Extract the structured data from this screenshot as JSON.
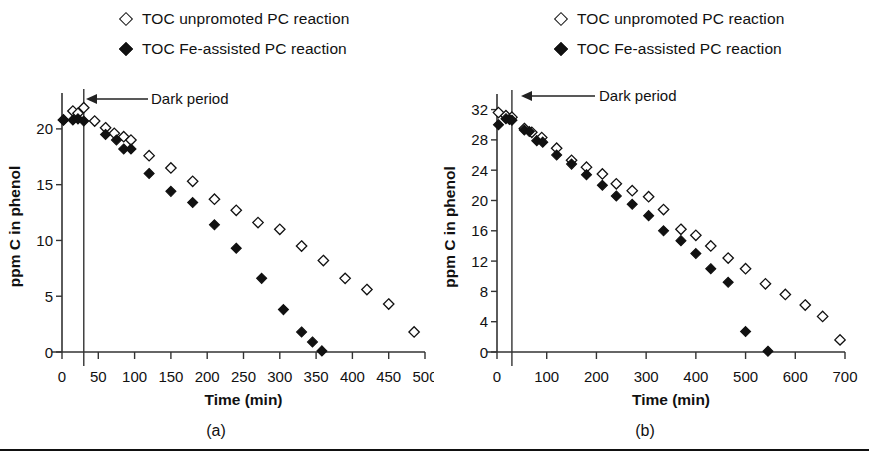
{
  "figure": {
    "background": "#ffffff",
    "marker_open_color": "#ffffff",
    "marker_edge_color": "#111111",
    "marker_filled_color": "#111111",
    "axis_color": "#333333"
  },
  "legend": {
    "series": [
      {
        "marker": "open-diamond-icon",
        "label": "TOC unpromoted PC reaction"
      },
      {
        "marker": "filled-diamond-icon",
        "label": "TOC Fe-assisted PC reaction"
      }
    ]
  },
  "panels": [
    {
      "id": "a",
      "caption": "(a)",
      "annotation": "Dark period"
    },
    {
      "id": "b",
      "caption": "(b)",
      "annotation": "Dark period"
    }
  ],
  "chart_data": [
    {
      "type": "scatter",
      "panel": "(a)",
      "title": "",
      "xlabel": "Time (min)",
      "ylabel": "ppm C in phenol",
      "xlim": [
        0,
        500
      ],
      "ylim": [
        0,
        22.5
      ],
      "xticks": [
        0,
        50,
        100,
        150,
        200,
        250,
        300,
        350,
        400,
        450,
        500
      ],
      "yticks": [
        0,
        5,
        10,
        15,
        20
      ],
      "xtick_labels": [
        "0",
        "50",
        "100",
        "150",
        "200",
        "250",
        "300",
        "350",
        "400",
        "450",
        "500"
      ],
      "ytick_labels": [
        "0",
        "5",
        "10",
        "15",
        "20"
      ],
      "grid": false,
      "legend_position": "top-center",
      "annotations": [
        {
          "text": "Dark period",
          "type": "arrow-left",
          "x": 30,
          "y": 22.2
        }
      ],
      "vertical_line": {
        "x": 30,
        "label": "dark period end"
      },
      "series": [
        {
          "name": "TOC unpromoted PC reaction",
          "marker": "open-diamond",
          "x": [
            2,
            15,
            22,
            30,
            45,
            60,
            72,
            85,
            95,
            120,
            150,
            180,
            210,
            240,
            270,
            300,
            330,
            360,
            390,
            420,
            450,
            485
          ],
          "y": [
            20.8,
            21.6,
            21.4,
            21.9,
            20.7,
            20.1,
            19.6,
            19.3,
            19.0,
            17.6,
            16.5,
            15.3,
            13.7,
            12.7,
            11.6,
            11.0,
            9.5,
            8.2,
            6.6,
            5.6,
            4.3,
            1.8
          ]
        },
        {
          "name": "TOC Fe-assisted PC reaction",
          "marker": "filled-diamond",
          "x": [
            2,
            15,
            22,
            30,
            60,
            75,
            85,
            95,
            120,
            150,
            180,
            210,
            240,
            275,
            305,
            330,
            345,
            358
          ],
          "y": [
            20.8,
            20.8,
            20.9,
            20.7,
            19.5,
            19.0,
            18.2,
            18.2,
            16.0,
            14.4,
            13.4,
            11.4,
            9.3,
            6.6,
            3.8,
            1.8,
            0.9,
            0.1
          ]
        }
      ]
    },
    {
      "type": "scatter",
      "panel": "(b)",
      "title": "",
      "xlabel": "Time (min)",
      "ylabel": "ppm C in phenol",
      "xlim": [
        0,
        700
      ],
      "ylim": [
        0,
        33
      ],
      "xticks": [
        0,
        100,
        200,
        300,
        400,
        500,
        600,
        700
      ],
      "yticks": [
        0,
        4,
        8,
        12,
        16,
        20,
        24,
        28,
        32
      ],
      "xtick_labels": [
        "0",
        "100",
        "200",
        "300",
        "400",
        "500",
        "600",
        "700"
      ],
      "ytick_labels": [
        "0",
        "4",
        "8",
        "12",
        "16",
        "20",
        "24",
        "28",
        "32"
      ],
      "grid": false,
      "legend_position": "top-center",
      "annotations": [
        {
          "text": "Dark period",
          "type": "arrow-left",
          "x": 30,
          "y": 32.6
        }
      ],
      "vertical_line": {
        "x": 30,
        "label": "dark period end"
      },
      "series": [
        {
          "name": "TOC unpromoted PC reaction",
          "marker": "open-diamond",
          "x": [
            3,
            18,
            30,
            55,
            70,
            90,
            120,
            150,
            180,
            212,
            240,
            272,
            305,
            335,
            370,
            400,
            430,
            465,
            500,
            540,
            580,
            620,
            655,
            690
          ],
          "y": [
            31.6,
            31.2,
            31.0,
            29.5,
            29.0,
            28.3,
            26.9,
            25.3,
            24.4,
            23.5,
            22.2,
            21.3,
            20.5,
            18.8,
            16.2,
            15.4,
            14.0,
            12.4,
            11.0,
            9.0,
            7.6,
            6.2,
            4.7,
            1.6
          ]
        },
        {
          "name": "TOC Fe-assisted PC reaction",
          "marker": "filled-diamond",
          "x": [
            3,
            18,
            25,
            30,
            55,
            65,
            80,
            92,
            120,
            150,
            180,
            212,
            240,
            272,
            305,
            335,
            370,
            400,
            430,
            465,
            500,
            545
          ],
          "y": [
            30.0,
            30.8,
            30.7,
            30.6,
            29.3,
            29.1,
            27.9,
            27.7,
            26.0,
            24.8,
            23.4,
            22.0,
            20.6,
            19.5,
            18.0,
            16.0,
            14.7,
            13.0,
            11.0,
            9.2,
            2.7,
            0.1
          ]
        }
      ]
    }
  ]
}
